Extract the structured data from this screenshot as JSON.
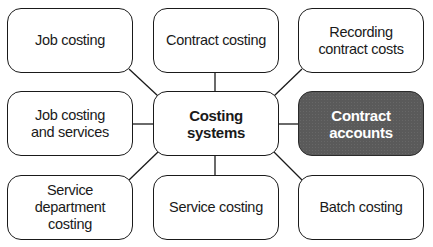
{
  "diagram": {
    "type": "hub-and-spoke",
    "center": {
      "label": "Costing systems",
      "emphasis": "bold"
    },
    "nodes": [
      {
        "id": "job-costing",
        "label": "Job costing",
        "position": "top-left"
      },
      {
        "id": "contract-costing",
        "label": "Contract costing",
        "position": "top-center"
      },
      {
        "id": "recording-contract-costs",
        "label": "Recording contract costs",
        "position": "top-right"
      },
      {
        "id": "job-costing-services",
        "label": "Job costing and services",
        "position": "middle-left"
      },
      {
        "id": "contract-accounts",
        "label": "Contract accounts",
        "position": "middle-right",
        "highlighted": true
      },
      {
        "id": "service-department-costing",
        "label": "Service department costing",
        "position": "bottom-left"
      },
      {
        "id": "service-costing",
        "label": "Service costing",
        "position": "bottom-center"
      },
      {
        "id": "batch-costing",
        "label": "Batch costing",
        "position": "bottom-right"
      }
    ],
    "colors": {
      "border": "#1a1a1a",
      "highlight_fill": "#5a5a5a",
      "highlight_text": "#ffffff",
      "background": "#ffffff"
    }
  }
}
